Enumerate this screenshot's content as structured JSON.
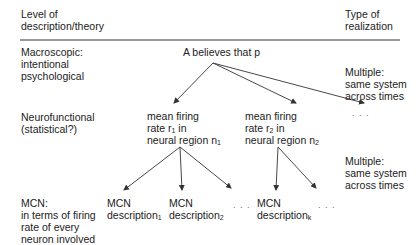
{
  "header": {
    "left": [
      "Level of",
      "description/theory"
    ],
    "right": [
      "Type of",
      "realization"
    ]
  },
  "rows": [
    {
      "level": [
        "Macroscopic:",
        "intentional",
        "psychological"
      ],
      "realization": [
        "Multiple:",
        "same system",
        "across times"
      ]
    },
    {
      "level": [
        "Neurofunctional",
        "(statistical?)"
      ],
      "realization": [
        "Multiple:",
        "same system",
        "across times"
      ]
    },
    {
      "level": [
        "MCN:",
        "in terms of firing",
        "rate of every",
        "neuron involved"
      ]
    }
  ],
  "nodes": {
    "root": "A believes that p",
    "neuro1": {
      "l1": "mean firing",
      "l2a": "rate r",
      "l2sub": "1",
      "l2b": " in",
      "l3a": "neural region n",
      "l3sub": "1"
    },
    "neuro2": {
      "l1": "mean firing",
      "l2a": "rate r",
      "l2sub": "2",
      "l2b": " in",
      "l3a": "neural region n",
      "l3sub": "2"
    },
    "mcn1": {
      "l1": "MCN",
      "l2a": "description",
      "l2sub": "1"
    },
    "mcn2": {
      "l1": "MCN",
      "l2a": "description",
      "l2sub": "2"
    },
    "mcnk": {
      "l1": "MCN",
      "l2a": "description",
      "l2sub": "k"
    },
    "ellipsis": ". . ."
  }
}
